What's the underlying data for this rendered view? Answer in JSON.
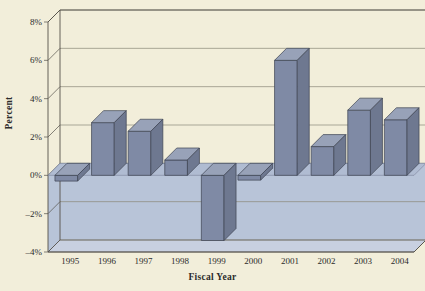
{
  "chart_data": {
    "type": "bar",
    "title": "",
    "xlabel": "Fiscal Year",
    "ylabel": "Percent",
    "categories": [
      "1995",
      "1996",
      "1997",
      "1998",
      "1999",
      "2000",
      "2001",
      "2002",
      "2003",
      "2004"
    ],
    "values": [
      -0.3,
      2.75,
      2.3,
      0.8,
      -3.4,
      -0.25,
      6.0,
      1.5,
      3.4,
      2.9
    ],
    "ylim": [
      -4,
      8
    ],
    "ytick_values": [
      8,
      6,
      4,
      2,
      0,
      -2,
      -4
    ],
    "ytick_labels": [
      "8%",
      "6%",
      "4%",
      "2%",
      "0%",
      "–2%",
      "–4%"
    ],
    "grid": true,
    "legend": false,
    "style": "3d-bar",
    "colors": {
      "bar_face": "#7f8aa5",
      "bar_top": "#98a2b8",
      "bar_side": "#6e7890",
      "bar_outline": "#3d4352",
      "plot_background": "#f2eeda",
      "below_zero_fill": "#b8c4d8",
      "gridline": "#8a8678",
      "axis_line": "#55514a",
      "page_background": "#f2eeda",
      "text": "#2b2b2b"
    }
  },
  "axes": {
    "y_title": "Percent",
    "x_title": "Fiscal Year"
  }
}
